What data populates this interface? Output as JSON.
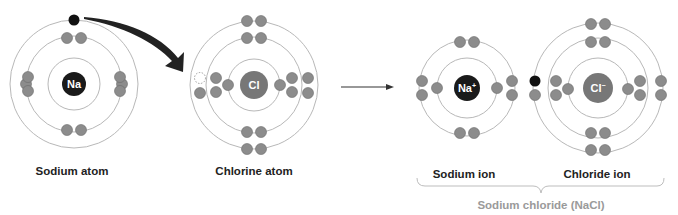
{
  "labels": {
    "sodium_atom": "Sodium atom",
    "chlorine_atom": "Chlorine atom",
    "sodium_ion": "Sodium ion",
    "chloride_ion": "Chloride ion",
    "compound": "Sodium chloride (NaCl)"
  },
  "colors": {
    "shell": "#b8b8b8",
    "electron": "#8c8c8c",
    "electron_stroke": "#6a6a6a",
    "transferred_electron": "#111111",
    "na_nucleus": "#1a1a1a",
    "cl_nucleus": "#777777",
    "arrow": "#222222",
    "bracket": "#bdbdbd"
  },
  "atoms": [
    {
      "id": "sodium-atom",
      "symbol": "Na",
      "superscript": "",
      "cx": 74,
      "cy": 84,
      "nucleus_r": 12,
      "nucleus_color": "na_nucleus",
      "shells": [
        26,
        48,
        64
      ],
      "electrons": [
        [
          -48,
          84,
          "e"
        ],
        [
          48,
          84,
          "e"
        ],
        [
          -7,
          38,
          "e"
        ],
        [
          7,
          38,
          "e"
        ],
        [
          -7,
          130,
          "e"
        ],
        [
          7,
          130,
          "e"
        ],
        [
          -46,
          77,
          "e"
        ],
        [
          -46,
          91,
          "e"
        ],
        [
          46,
          77,
          "e"
        ],
        [
          46,
          91,
          "e"
        ],
        [
          0,
          20,
          "t"
        ]
      ]
    },
    {
      "id": "chlorine-atom",
      "symbol": "Cl",
      "superscript": "",
      "cx": 254,
      "cy": 85,
      "nucleus_r": 14,
      "nucleus_color": "cl_nucleus",
      "shells": [
        26,
        48,
        64
      ],
      "electrons": [
        [
          -26,
          85,
          "e"
        ],
        [
          26,
          85,
          "e"
        ],
        [
          -7,
          38,
          "e"
        ],
        [
          7,
          38,
          "e"
        ],
        [
          -7,
          132,
          "e"
        ],
        [
          7,
          132,
          "e"
        ],
        [
          -38,
          78,
          "e"
        ],
        [
          -38,
          92,
          "e"
        ],
        [
          38,
          78,
          "e"
        ],
        [
          38,
          92,
          "e"
        ],
        [
          -7,
          21,
          "e"
        ],
        [
          7,
          21,
          "e"
        ],
        [
          -7,
          149,
          "e"
        ],
        [
          7,
          149,
          "e"
        ],
        [
          -54,
          93,
          "e"
        ],
        [
          54,
          78,
          "e"
        ],
        [
          54,
          93,
          "e"
        ],
        [
          -54,
          78,
          "h"
        ]
      ]
    },
    {
      "id": "sodium-ion",
      "symbol": "Na",
      "superscript": "+",
      "cx": 467,
      "cy": 88,
      "nucleus_r": 13,
      "nucleus_color": "na_nucleus",
      "shells": [
        30,
        48
      ],
      "electrons": [
        [
          -30,
          88,
          "e"
        ],
        [
          30,
          88,
          "e"
        ],
        [
          -7,
          42,
          "e"
        ],
        [
          7,
          42,
          "e"
        ],
        [
          -7,
          133,
          "e"
        ],
        [
          7,
          133,
          "e"
        ],
        [
          -45,
          81,
          "e"
        ],
        [
          -45,
          95,
          "e"
        ],
        [
          45,
          81,
          "e"
        ],
        [
          45,
          95,
          "e"
        ]
      ]
    },
    {
      "id": "chloride-ion",
      "symbol": "Cl",
      "superscript": "−",
      "cx": 598,
      "cy": 88,
      "nucleus_r": 15,
      "nucleus_color": "cl_nucleus",
      "shells": [
        30,
        50,
        65
      ],
      "electrons": [
        [
          -30,
          89,
          "e"
        ],
        [
          30,
          89,
          "e"
        ],
        [
          -7,
          42,
          "e"
        ],
        [
          7,
          42,
          "e"
        ],
        [
          -7,
          133,
          "e"
        ],
        [
          7,
          133,
          "e"
        ],
        [
          -42,
          81,
          "e"
        ],
        [
          -42,
          95,
          "e"
        ],
        [
          42,
          81,
          "e"
        ],
        [
          42,
          95,
          "e"
        ],
        [
          -7,
          24,
          "e"
        ],
        [
          7,
          24,
          "e"
        ],
        [
          -7,
          150,
          "e"
        ],
        [
          7,
          150,
          "e"
        ],
        [
          -63,
          95,
          "e"
        ],
        [
          63,
          81,
          "e"
        ],
        [
          63,
          95,
          "e"
        ],
        [
          -63,
          81,
          "t"
        ]
      ]
    }
  ],
  "label_positions": {
    "sodium_atom": [
      72,
      165
    ],
    "chlorine_atom": [
      254,
      165
    ],
    "sodium_ion": [
      464,
      168
    ],
    "chloride_ion": [
      597,
      168
    ],
    "compound": [
      541,
      199
    ]
  }
}
